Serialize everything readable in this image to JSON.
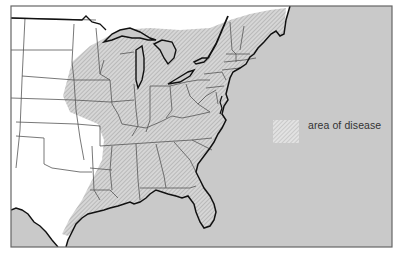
{
  "map": {
    "title": "",
    "subject": "Eastern United States",
    "colors": {
      "ocean": "#c9c9c9",
      "land": "#ffffff",
      "disease_fill": "#d4d4d4",
      "hatch": "#9a9a9a",
      "border": "#555555",
      "coast": "#111111",
      "frame": "#666666"
    },
    "legend": {
      "items": [
        {
          "symbol": "hatched-swatch",
          "label": "area of disease"
        }
      ]
    }
  }
}
